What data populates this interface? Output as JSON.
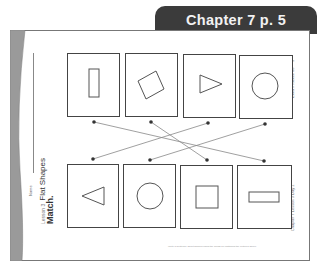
{
  "banner": {
    "label": "Chapter 7  p. 5",
    "color": "#3b3b3b"
  },
  "worksheet": {
    "name_label": "Name",
    "lesson_label": "Lesson 3",
    "lesson_title": "Flat Shapes",
    "instruction": "Match.",
    "right_header": "Extra Practice 68",
    "right_page": "3",
    "right_footer": "Chapter 7   Lesson 3   Day 1",
    "footer_note": "Write a sentence about shapes using the words for matching the pictures above."
  },
  "top_row": [
    {
      "shape": "rectangle-vertical"
    },
    {
      "shape": "square-rotated"
    },
    {
      "shape": "triangle-right"
    },
    {
      "shape": "circle"
    }
  ],
  "bottom_row": [
    {
      "shape": "triangle-left"
    },
    {
      "shape": "circle"
    },
    {
      "shape": "square"
    },
    {
      "shape": "rectangle-horizontal"
    }
  ],
  "matches": [
    {
      "from_top": 1,
      "to_bottom": 4
    },
    {
      "from_top": 2,
      "to_bottom": 3
    },
    {
      "from_top": 3,
      "to_bottom": 1
    },
    {
      "from_top": 4,
      "to_bottom": 2
    }
  ]
}
